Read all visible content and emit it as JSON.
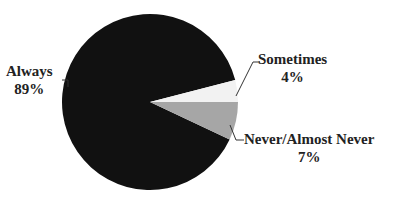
{
  "chart_data": {
    "type": "pie",
    "title": "",
    "categories": [
      "Always",
      "Sometimes",
      "Never/Almost Never"
    ],
    "values": [
      89,
      4,
      7
    ],
    "labels": [
      "89%",
      "4%",
      "7%"
    ],
    "colors": [
      "#111111",
      "#f2f2f2",
      "#a6a6a6"
    ],
    "legend": "none (callout labels)"
  },
  "labels": {
    "always_name": "Always",
    "always_pct": "89%",
    "sometimes_name": "Sometimes",
    "sometimes_pct": "4%",
    "never_name": "Never/Almost Never",
    "never_pct": "7%"
  }
}
